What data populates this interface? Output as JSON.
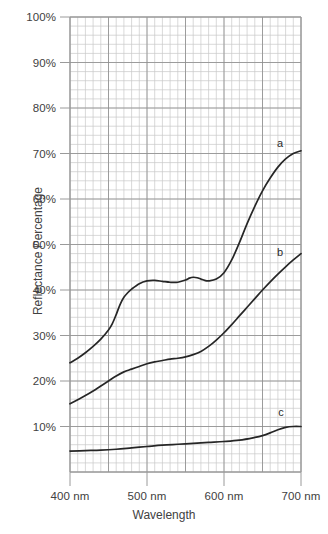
{
  "chart_data": {
    "type": "line",
    "title": "",
    "xlabel": "Wavelength",
    "ylabel": "Reflectance Percentage",
    "xlim": [
      400,
      700
    ],
    "ylim": [
      0,
      100
    ],
    "grid": true,
    "minor_grid": true,
    "legend_position": "inline-end-of-curve",
    "x_unit": "nm",
    "y_unit": "%",
    "x_tick_labels": [
      "400 nm",
      "500 nm",
      "600 nm",
      "700 nm"
    ],
    "x_ticks": [
      400,
      500,
      600,
      700
    ],
    "y_tick_labels": [
      "100%",
      "90%",
      "80%",
      "70%",
      "60%",
      "50%",
      "40%",
      "30%",
      "20%",
      "10%"
    ],
    "y_ticks": [
      100,
      90,
      80,
      70,
      60,
      50,
      40,
      30,
      20,
      10
    ],
    "series": [
      {
        "name": "a",
        "label": "a",
        "color": "#262626",
        "x": [
          400,
          410,
          420,
          430,
          440,
          450,
          455,
          460,
          465,
          470,
          475,
          480,
          490,
          500,
          510,
          520,
          530,
          540,
          550,
          555,
          560,
          565,
          570,
          575,
          580,
          590,
          600,
          610,
          620,
          630,
          640,
          650,
          660,
          670,
          680,
          690,
          700
        ],
        "values": [
          24.0,
          25.0,
          26.2,
          27.6,
          29.2,
          31.2,
          32.6,
          34.6,
          36.8,
          38.4,
          39.4,
          40.2,
          41.4,
          42.0,
          42.1,
          41.9,
          41.7,
          41.7,
          42.2,
          42.6,
          42.8,
          42.7,
          42.4,
          42.1,
          42.0,
          42.4,
          43.8,
          46.6,
          50.4,
          54.6,
          58.4,
          61.8,
          64.6,
          67.0,
          68.8,
          70.0,
          70.6
        ]
      },
      {
        "name": "b",
        "label": "b",
        "color": "#262626",
        "x": [
          400,
          410,
          420,
          430,
          440,
          450,
          460,
          470,
          480,
          490,
          500,
          510,
          520,
          530,
          540,
          550,
          560,
          570,
          580,
          590,
          600,
          610,
          620,
          630,
          640,
          650,
          660,
          670,
          680,
          690,
          700
        ],
        "values": [
          15.0,
          15.9,
          16.8,
          17.8,
          18.9,
          20.0,
          21.1,
          22.0,
          22.6,
          23.2,
          23.8,
          24.2,
          24.5,
          24.8,
          25.0,
          25.3,
          25.8,
          26.5,
          27.6,
          29.0,
          30.6,
          32.4,
          34.3,
          36.2,
          38.1,
          40.0,
          41.8,
          43.5,
          45.1,
          46.6,
          48.0
        ]
      },
      {
        "name": "c",
        "label": "c",
        "color": "#262626",
        "x": [
          400,
          420,
          440,
          460,
          480,
          500,
          520,
          540,
          560,
          580,
          600,
          620,
          640,
          650,
          660,
          670,
          680,
          690,
          700
        ],
        "values": [
          4.6,
          4.7,
          4.8,
          5.0,
          5.3,
          5.6,
          5.9,
          6.1,
          6.3,
          6.5,
          6.7,
          7.0,
          7.6,
          8.0,
          8.6,
          9.3,
          9.8,
          10.0,
          10.0
        ]
      }
    ]
  },
  "axes": {
    "y_title": "Reflectance Percentage",
    "x_title": "Wavelength",
    "y_labels": [
      {
        "text": "100%",
        "value": 100
      },
      {
        "text": "90%",
        "value": 90
      },
      {
        "text": "80%",
        "value": 80
      },
      {
        "text": "70%",
        "value": 70
      },
      {
        "text": "60%",
        "value": 60
      },
      {
        "text": "50%",
        "value": 50
      },
      {
        "text": "40%",
        "value": 40
      },
      {
        "text": "30%",
        "value": 30
      },
      {
        "text": "20%",
        "value": 20
      },
      {
        "text": "10%",
        "value": 10
      }
    ],
    "x_labels": [
      {
        "text": "400 nm",
        "value": 400
      },
      {
        "text": "500 nm",
        "value": 500
      },
      {
        "text": "600 nm",
        "value": 600
      },
      {
        "text": "700 nm",
        "value": 700
      }
    ]
  },
  "curve_labels": [
    {
      "text": "a",
      "x": 280,
      "y": 143
    },
    {
      "text": "b",
      "x": 280,
      "y": 252
    },
    {
      "text": "c",
      "x": 281,
      "y": 412
    }
  ],
  "colors": {
    "background": "#ffffff",
    "curve": "#262626",
    "grid_minor": "#c9c9c9",
    "grid_major": "#8d8d8d",
    "axis": "#9a9a9a",
    "text": "#414141"
  }
}
